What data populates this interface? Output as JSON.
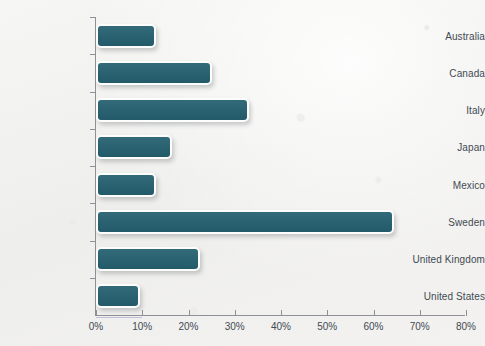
{
  "chart_data": {
    "type": "bar",
    "orientation": "horizontal",
    "title": "",
    "subtitle": "",
    "xlabel": "",
    "ylabel": "",
    "categories": [
      "Australia",
      "Canada",
      "Italy",
      "Japan",
      "Mexico",
      "Sweden",
      "United Kingdom",
      "United States"
    ],
    "values": [
      13,
      25,
      33,
      16.5,
      13,
      64.5,
      22.5,
      9.5
    ],
    "value_unit": "%",
    "xlim": [
      0,
      80
    ],
    "x_tick_values": [
      0,
      10,
      20,
      30,
      40,
      50,
      60,
      70,
      80
    ],
    "x_tick_labels": [
      "0%",
      "10%",
      "20%",
      "30%",
      "40%",
      "50%",
      "60%",
      "70%",
      "80%"
    ],
    "grid": false,
    "legend": "none",
    "bar_color": "#245f6f",
    "bar_border_color": "#fdfdfd",
    "axis_color": "#8d9196",
    "label_color": "#3f4a53",
    "background_color": "#f4f4f2"
  }
}
